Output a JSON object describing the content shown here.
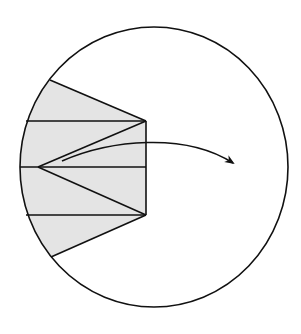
{
  "diagram": {
    "colors": {
      "background": "#ffffff",
      "stroke": "#111111",
      "shaded_fill": "#e4e4e4"
    },
    "circle": {
      "cx": 154,
      "cy": 167,
      "rx": 134,
      "ry": 140
    },
    "shaded_region": {
      "points": [
        [
          50,
          80
        ],
        [
          146,
          121
        ],
        [
          146,
          215
        ],
        [
          51,
          257
        ]
      ],
      "horizontal_lines_y": [
        121,
        167,
        215
      ],
      "fan_vertex": [
        38,
        167
      ],
      "right_vertices": [
        [
          146,
          121
        ],
        [
          146,
          215
        ]
      ]
    },
    "arrow": {
      "start": [
        62,
        161
      ],
      "control1": [
        110,
        140
      ],
      "control2": [
        185,
        132
      ],
      "end": [
        233,
        163
      ]
    }
  }
}
